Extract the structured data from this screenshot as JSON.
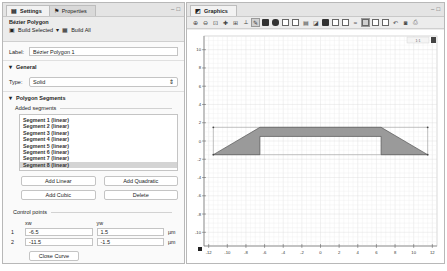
{
  "settings_panel": {
    "tabs": [
      {
        "label": "Settings",
        "icon": "settings-icon",
        "active": true
      },
      {
        "label": "Properties",
        "icon": "properties-icon",
        "active": false
      }
    ],
    "node_title": "Bézier Polygon",
    "build_selected": "Build Selected",
    "build_all": "Build All",
    "label_caption": "Label:",
    "label_value": "Bézier Polygon 1",
    "general_section": "General",
    "type_caption": "Type:",
    "type_value": "Solid",
    "polygon_section": "Polygon Segments",
    "added_segments": "Added segments",
    "segments": [
      "Segment 1 (linear)",
      "Segment 2 (linear)",
      "Segment 3 (linear)",
      "Segment 4 (linear)",
      "Segment 5 (linear)",
      "Segment 6 (linear)",
      "Segment 7 (linear)",
      "Segment 8 (linear)"
    ],
    "selected_segment_index": 7,
    "buttons": {
      "add_linear": "Add Linear",
      "add_quadratic": "Add Quadratic",
      "add_cubic": "Add Cubic",
      "delete": "Delete",
      "close_curve": "Close Curve"
    },
    "control_points": {
      "title": "Control points",
      "col_x": "xw",
      "col_y": "yw",
      "unit": "µm",
      "rows": [
        {
          "index": "1",
          "x": "-6.5",
          "y": "1.5"
        },
        {
          "index": "2",
          "x": "-11.5",
          "y": "-1.5"
        }
      ]
    }
  },
  "graphics_panel": {
    "tab_label": "Graphics",
    "tab_icon": "graphics-icon",
    "toolbar_icons": [
      "zoom-in-icon",
      "zoom-out-icon",
      "zoom-box-icon",
      "zoom-selected-icon",
      "zoom-extents-icon",
      "axis-orientation-icon",
      "select-objects-icon",
      "select-domains-icon",
      "select-boundaries-icon",
      "select-edges-icon",
      "select-points-icon",
      "wireframe-icon",
      "hide-icon",
      "show-icon",
      "view-icon",
      "transparency-icon",
      "grid-icon",
      "scene-light-icon",
      "reset-view-icon",
      "undo-icon",
      "screenshot-icon",
      "print-icon"
    ],
    "scale_readout": "1:1"
  },
  "chart_data": {
    "type": "geometry",
    "x_ticks": [
      -12,
      -10,
      -8,
      -6,
      -4,
      -2,
      0,
      2,
      4,
      6,
      8,
      10,
      12
    ],
    "y_ticks": [
      10,
      8,
      6,
      4,
      2,
      0,
      -2,
      -4,
      -6,
      -8,
      -10
    ],
    "xlim": [
      -12.5,
      12.5
    ],
    "ylim": [
      -11.5,
      11.5
    ],
    "grid": true,
    "polygon": [
      [
        -11.5,
        -1.5
      ],
      [
        -6.5,
        1.5
      ],
      [
        6.5,
        1.5
      ],
      [
        11.5,
        -1.5
      ],
      [
        6.5,
        -1.5
      ],
      [
        6.5,
        0.5
      ],
      [
        -6.5,
        0.5
      ],
      [
        -6.5,
        -1.5
      ]
    ],
    "control_box": [
      [
        -11.5,
        1.5
      ],
      [
        11.5,
        1.5
      ],
      [
        11.5,
        -1.5
      ],
      [
        -11.5,
        -1.5
      ]
    ],
    "fill_color": "#9a9a9a",
    "edge_color": "#555555"
  }
}
